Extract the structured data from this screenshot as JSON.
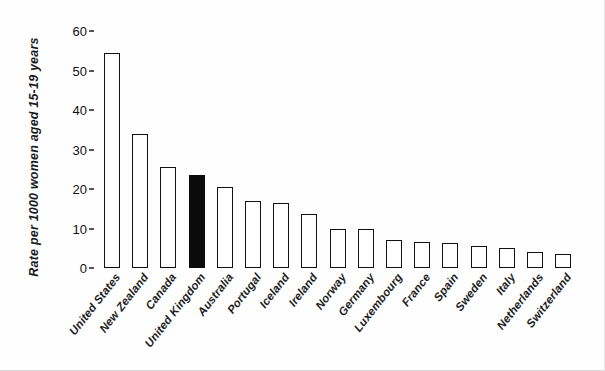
{
  "chart_data": {
    "type": "bar",
    "title": "",
    "xlabel": "",
    "ylabel": "Rate per 1000 women aged 15-19 years",
    "ylim": [
      0,
      60
    ],
    "ytick_values": [
      0,
      10,
      20,
      30,
      40,
      50,
      60
    ],
    "ytick_labels": [
      "0",
      "10",
      "20",
      "30",
      "40",
      "50",
      "60"
    ],
    "grid": false,
    "legend": "none",
    "highlight_category": "United Kingdom",
    "highlight_color": "#0b0b0b",
    "bar_color": "#ffffff",
    "bar_edge_color": "#121212",
    "categories": [
      "United States",
      "New Zealand",
      "Canada",
      "United Kingdom",
      "Australia",
      "Portugal",
      "Iceland",
      "Ireland",
      "Norway",
      "Germany",
      "Luxembourg",
      "France",
      "Spain",
      "Sweden",
      "Italy",
      "Netherlands",
      "Switzerland"
    ],
    "values": [
      54.4,
      34.0,
      25.5,
      23.5,
      20.5,
      17.0,
      16.5,
      13.7,
      10.0,
      9.8,
      7.0,
      6.5,
      6.3,
      5.5,
      5.0,
      4.0,
      3.5
    ],
    "filled": [
      false,
      false,
      false,
      true,
      false,
      false,
      false,
      false,
      false,
      false,
      false,
      false,
      false,
      false,
      false,
      false,
      false
    ]
  }
}
